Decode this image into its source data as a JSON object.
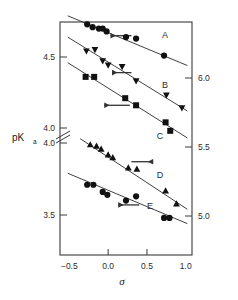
{
  "chart_data": {
    "type": "scatter",
    "title": "",
    "xlabel": "σ",
    "ylabel": "pK",
    "ylabel_sub": "a",
    "xlim": [
      -0.62,
      1.08
    ],
    "xticks": [
      -0.5,
      0.0,
      0.5,
      1.0
    ],
    "xticklabels": [
      "−0.5",
      "0.0",
      "0.5",
      "1.0"
    ],
    "grid": false,
    "legend": "inline-series-letters",
    "axis_break": {
      "present": true,
      "side": "left",
      "style": "double-slash"
    },
    "left_axis": {
      "upper_ticks": [
        4.5,
        4.0
      ],
      "upper_ticklabels": [
        "4.5",
        "4.0"
      ],
      "lower_ticks": [
        4.0,
        3.5
      ],
      "lower_ticklabels": [
        "4.0",
        "3.5"
      ]
    },
    "right_axis": {
      "ticks": [
        6.0,
        5.5,
        5.0
      ],
      "ticklabels": [
        "6.0",
        "5.5",
        "5.0"
      ]
    },
    "series": [
      {
        "name": "A",
        "label": "A",
        "marker": "circle",
        "color": "#111111",
        "points": [
          {
            "x": -0.27,
            "y": 4.73
          },
          {
            "x": -0.2,
            "y": 4.71
          },
          {
            "x": -0.12,
            "y": 4.7
          },
          {
            "x": -0.07,
            "y": 4.7
          },
          {
            "x": -0.02,
            "y": 4.68
          },
          {
            "x": 0.23,
            "y": 4.64
          },
          {
            "x": 0.36,
            "y": 4.63
          },
          {
            "x": 0.72,
            "y": 4.51
          }
        ],
        "fit_line": {
          "x0": -0.52,
          "y0": 4.79,
          "x1": 1.02,
          "y1": 4.44
        },
        "arrow": {
          "x_tail": 0.3,
          "x_head": 0.03,
          "y": 4.65,
          "direction": "left"
        }
      },
      {
        "name": "B",
        "label": "B",
        "marker": "triangle-down",
        "color": "#111111",
        "points": [
          {
            "x": -0.28,
            "y": 4.54
          },
          {
            "x": -0.17,
            "y": 4.55
          },
          {
            "x": -0.07,
            "y": 4.47
          },
          {
            "x": 0.0,
            "y": 4.44
          },
          {
            "x": 0.18,
            "y": 4.43
          },
          {
            "x": 0.36,
            "y": 4.33
          },
          {
            "x": 0.75,
            "y": 4.23
          },
          {
            "x": 0.95,
            "y": 4.14
          }
        ],
        "fit_line": {
          "x0": -0.52,
          "y0": 4.64,
          "x1": 1.02,
          "y1": 4.12
        },
        "arrow": {
          "x_tail": 0.3,
          "x_head": 0.05,
          "y": 4.39,
          "direction": "left"
        }
      },
      {
        "name": "C",
        "label": "C",
        "marker": "square",
        "color": "#111111",
        "points": [
          {
            "x": -0.29,
            "y": 4.36
          },
          {
            "x": -0.18,
            "y": 4.36
          },
          {
            "x": 0.22,
            "y": 4.21
          },
          {
            "x": 0.36,
            "y": 4.16
          },
          {
            "x": 0.74,
            "y": 4.04
          },
          {
            "x": 0.8,
            "y": 3.98
          }
        ],
        "fit_line": {
          "x0": -0.52,
          "y0": 4.46,
          "x1": 1.02,
          "y1": 3.93
        },
        "arrow": {
          "x_tail": 0.28,
          "x_head": -0.05,
          "y": 4.16,
          "direction": "left"
        }
      },
      {
        "name": "D",
        "label": "D",
        "marker": "triangle-up",
        "color": "#111111",
        "points": [
          {
            "x": -0.23,
            "y": 3.99
          },
          {
            "x": -0.15,
            "y": 3.98
          },
          {
            "x": -0.09,
            "y": 3.96
          },
          {
            "x": 0.0,
            "y": 3.92
          },
          {
            "x": 0.06,
            "y": 3.9
          },
          {
            "x": 0.26,
            "y": 3.83
          },
          {
            "x": 0.37,
            "y": 3.82
          },
          {
            "x": 0.74,
            "y": 3.67
          },
          {
            "x": 0.88,
            "y": 3.58
          }
        ],
        "fit_line": {
          "x0": -0.36,
          "y0": 4.03,
          "x1": 1.02,
          "y1": 3.54
        },
        "arrow": {
          "x_tail": 0.3,
          "x_head": 0.58,
          "y": 3.87,
          "direction": "right"
        }
      },
      {
        "name": "E",
        "label": "E",
        "marker": "circle",
        "color": "#111111",
        "points": [
          {
            "x": -0.27,
            "y": 3.71
          },
          {
            "x": -0.19,
            "y": 3.71
          },
          {
            "x": -0.07,
            "y": 3.66
          },
          {
            "x": -0.01,
            "y": 3.64
          },
          {
            "x": 0.23,
            "y": 3.6
          },
          {
            "x": 0.36,
            "y": 3.63
          },
          {
            "x": 0.72,
            "y": 3.48
          },
          {
            "x": 0.79,
            "y": 3.48
          }
        ],
        "fit_line": {
          "x0": -0.52,
          "y0": 3.79,
          "x1": 1.02,
          "y1": 3.44
        },
        "arrow": {
          "x_tail": 0.4,
          "x_head": 0.13,
          "y": 3.57,
          "direction": "left"
        }
      }
    ]
  }
}
